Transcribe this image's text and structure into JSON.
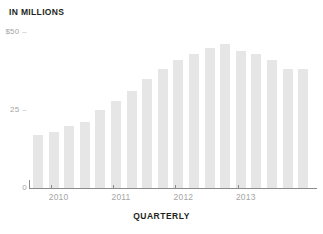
{
  "chart_data": {
    "type": "bar",
    "title": "IN MILLIONS",
    "xlabel": "QUARTERLY",
    "ylabel": "",
    "ylim": [
      0,
      50
    ],
    "grid": false,
    "legend": null,
    "bar_color": "#e6e6e6",
    "axis_color": "#8b8b8b",
    "tick_label_color": "#a5a5a5",
    "yticks": [
      {
        "value": 50,
        "label": "$50"
      },
      {
        "value": 25,
        "label": "25"
      },
      {
        "value": 0,
        "label": "0"
      }
    ],
    "xticks": [
      {
        "label": "2010",
        "index": 1
      },
      {
        "label": "2011",
        "index": 5
      },
      {
        "label": "2012",
        "index": 9
      },
      {
        "label": "2013",
        "index": 13
      }
    ],
    "categories": [
      "2009 Q4",
      "2010 Q1",
      "2010 Q2",
      "2010 Q3",
      "2010 Q4",
      "2011 Q1",
      "2011 Q2",
      "2011 Q3",
      "2011 Q4",
      "2012 Q1",
      "2012 Q2",
      "2012 Q3",
      "2012 Q4",
      "2013 Q1",
      "2013 Q2",
      "2013 Q3",
      "2013 Q4",
      "2014 Q1"
    ],
    "values": [
      17,
      18,
      20,
      21,
      25,
      28,
      31,
      35,
      38,
      41,
      43,
      45,
      46,
      44,
      43,
      41,
      38,
      38
    ]
  },
  "footer": {
    "caption": "QUARTERLY"
  }
}
